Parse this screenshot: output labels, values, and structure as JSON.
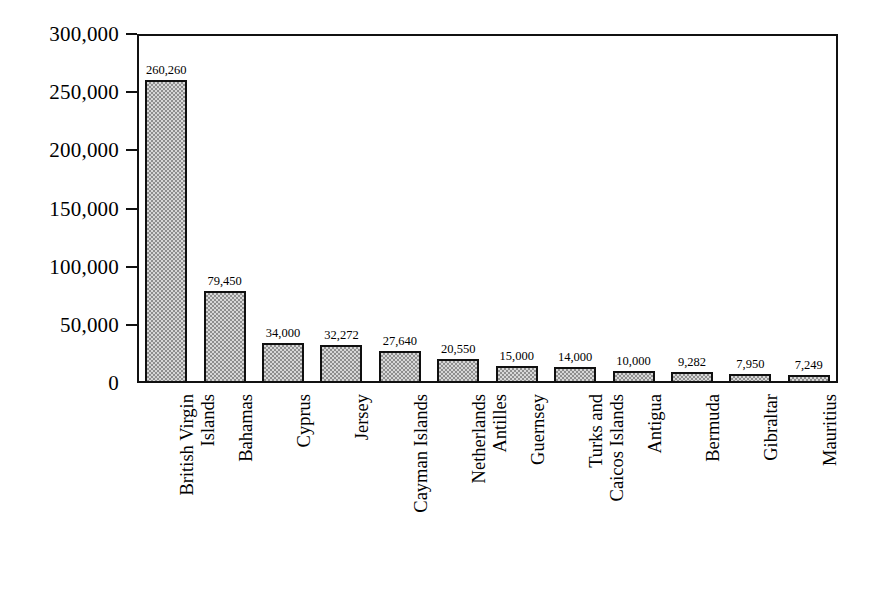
{
  "chart_data": {
    "type": "bar",
    "title": "",
    "xlabel": "",
    "ylabel": "",
    "ylim": [
      0,
      300000
    ],
    "grid": false,
    "legend": false,
    "orientation": "vertical",
    "y_ticks": [
      "0",
      "50,000",
      "100,000",
      "150,000",
      "200,000",
      "250,000",
      "300,000"
    ],
    "y_tick_values": [
      0,
      50000,
      100000,
      150000,
      200000,
      250000,
      300000
    ],
    "categories": [
      "British Virgin Islands",
      "Bahamas",
      "Cyprus",
      "Jersey",
      "Cayman Islands",
      "Netherlands Antilles",
      "Guernsey",
      "Turks and Caicos Islands",
      "Antigua",
      "Bermuda",
      "Gibraltar",
      "Mauritius"
    ],
    "category_lines": [
      [
        "British Virgin",
        "Islands"
      ],
      [
        "Bahamas"
      ],
      [
        "Cyprus"
      ],
      [
        "Jersey"
      ],
      [
        "Cayman Islands"
      ],
      [
        "Netherlands",
        "Antilles"
      ],
      [
        "Guernsey"
      ],
      [
        "Turks and",
        "Caicos Islands"
      ],
      [
        "Antigua"
      ],
      [
        "Bermuda"
      ],
      [
        "Gibraltar"
      ],
      [
        "Mauritius"
      ]
    ],
    "values": [
      260260,
      79450,
      34000,
      32272,
      27640,
      20550,
      15000,
      14000,
      10000,
      9282,
      7950,
      7249
    ],
    "value_labels": [
      "260,260",
      "79,450",
      "34,000",
      "32,272",
      "27,640",
      "20,550",
      "15,000",
      "14,000",
      "10,000",
      "9,282",
      "7,950",
      "7,249"
    ],
    "colors": {
      "bar_fill": "#d8d8d8",
      "bar_pattern": "#8f8f8f",
      "bar_border": "#101010",
      "axis": "#111111",
      "text": "#000000",
      "background": "#ffffff"
    }
  }
}
